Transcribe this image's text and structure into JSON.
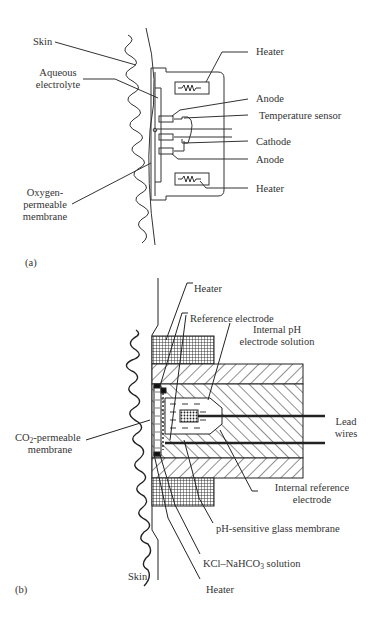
{
  "panel_a": {
    "tag": "(a)",
    "labels": {
      "skin": "Skin",
      "aqueous_electrolyte_1": "Aqueous",
      "aqueous_electrolyte_2": "electrolyte",
      "heater_top": "Heater",
      "anode_top": "Anode",
      "temperature_sensor": "Temperature sensor",
      "cathode": "Cathode",
      "anode_bottom": "Anode",
      "heater_bottom": "Heater",
      "membrane_1": "Oxygen-",
      "membrane_2": "permeable",
      "membrane_3": "membrane"
    }
  },
  "panel_b": {
    "tag": "(b)",
    "labels": {
      "heater_top": "Heater",
      "reference_electrode": "Reference electrode",
      "internal_ph_1": "Internal pH",
      "internal_ph_2": "electrode solution",
      "lead_wires_1": "Lead",
      "lead_wires_2": "wires",
      "co2_membrane_prefix": "CO",
      "co2_membrane_sub": "2",
      "co2_membrane_suffix": "-permeable",
      "co2_membrane_2": "membrane",
      "internal_reference_1": "Internal reference",
      "internal_reference_2": "electrode",
      "ph_glass_membrane": "pH-sensitive glass membrane",
      "kcl_prefix": "KCl–NaHCO",
      "kcl_sub": "3",
      "kcl_suffix": " solution",
      "heater_bottom": "Heater",
      "skin": "Skin"
    }
  }
}
